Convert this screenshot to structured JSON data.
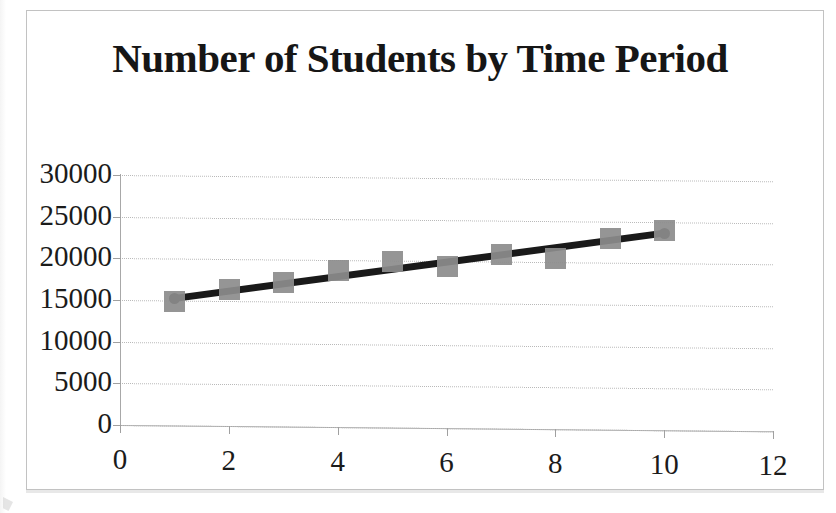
{
  "chart_data": {
    "type": "scatter",
    "title": "Number of Students by Time Period",
    "xlabel": "",
    "ylabel": "",
    "x": [
      1,
      2,
      3,
      4,
      5,
      6,
      7,
      8,
      9,
      10
    ],
    "values": [
      15000,
      16400,
      17400,
      18800,
      20000,
      19400,
      21000,
      20600,
      23000,
      24000
    ],
    "series": [
      {
        "name": "Number of Students",
        "values": [
          15000,
          16400,
          17400,
          18800,
          20000,
          19400,
          21000,
          20600,
          23000,
          24000
        ]
      }
    ],
    "trendline": {
      "type": "linear",
      "x_start": 1,
      "y_start": 15300,
      "x_end": 10,
      "y_end": 23700
    },
    "xlim": [
      0,
      12
    ],
    "ylim": [
      0,
      30000
    ],
    "xticks": [
      0,
      2,
      4,
      6,
      8,
      10,
      12
    ],
    "yticks": [
      0,
      5000,
      10000,
      15000,
      20000,
      25000,
      30000
    ],
    "xtick_labels": [
      "0",
      "2",
      "4",
      "6",
      "8",
      "10",
      "12"
    ],
    "ytick_labels": [
      "0",
      "5000",
      "10000",
      "15000",
      "20000",
      "25000",
      "30000"
    ],
    "grid": "horizontal",
    "legend": "none",
    "marker_shape": "square",
    "marker_color": "#8c8c8c",
    "trendline_color": "#1a1a1a",
    "gridline_color": "#b9b9b9",
    "axis_color": "#a8a8a8",
    "frame_color": "#c2c2c2",
    "background_color": "#ffffff"
  }
}
